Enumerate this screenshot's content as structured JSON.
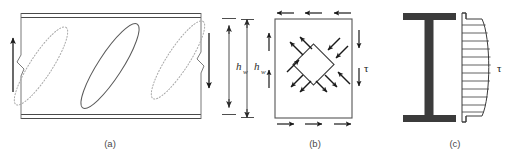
{
  "figure": {
    "background_color": "#ffffff",
    "line_color": "#3a3a3a",
    "dotted_color": "#9a9a9a",
    "solid_fill": "#3b3b3b",
    "panels": [
      {
        "id": "a",
        "caption": "(a)",
        "description": "Web panel with inclined tension field bands",
        "dimension_label": "h",
        "dimension_subscript": "w",
        "tension_bands": [
          {
            "style": "dotted",
            "position": "left"
          },
          {
            "style": "solid",
            "position": "center"
          },
          {
            "style": "dotted",
            "position": "right"
          }
        ],
        "edge_arrows": [
          {
            "side": "left",
            "direction": "up"
          },
          {
            "side": "right",
            "direction": "down"
          }
        ],
        "flange_style": "double-line"
      },
      {
        "id": "b",
        "caption": "(b)",
        "description": "Pure shear stress state on web panel with principal stress element",
        "dimension_label": "h",
        "dimension_subscript": "w",
        "stress_label": "τ",
        "boundary_shear_arrows": {
          "top": "left",
          "bottom": "right",
          "left": "up",
          "right": "down"
        },
        "element": {
          "shape": "rotated-square",
          "tension_axis": "NE-SW",
          "tension_arrow_count": 4,
          "tension_direction": "outward",
          "compression_axis": "NW-SE",
          "compression_arrow_count": 4,
          "compression_direction": "inward"
        }
      },
      {
        "id": "c",
        "caption": "(c)",
        "description": "I-section cross-section with shear stress distribution diagram",
        "stress_label": "τ",
        "section_type": "I-beam",
        "distribution": "parabolic-web-dominant",
        "hatch_line_count": 12
      }
    ]
  }
}
